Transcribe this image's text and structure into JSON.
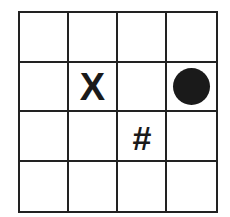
{
  "board": {
    "rows": 4,
    "cols": 4,
    "line_color": "#222222",
    "mark_color": "#1a1a1a",
    "cells": [
      [
        "",
        "",
        "",
        ""
      ],
      [
        "",
        "X",
        "",
        "●"
      ],
      [
        "",
        "",
        "#",
        ""
      ],
      [
        "",
        "",
        "",
        ""
      ]
    ],
    "marks": {
      "x": "X",
      "hash": "#",
      "circle": "filled-circle"
    }
  }
}
